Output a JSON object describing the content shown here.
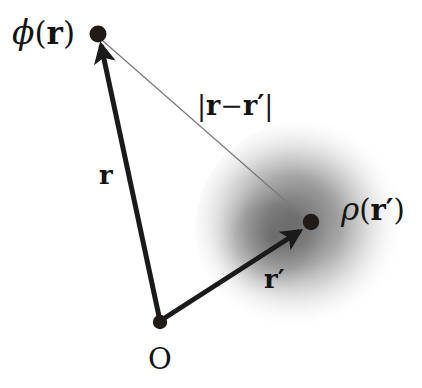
{
  "figure": {
    "background_color": "#ffffff",
    "width": 422,
    "height": 388
  },
  "colors": {
    "ink": "#141414",
    "vector": "#1a1a1a",
    "thin_line": "#7a7a7a",
    "cloud_core": "#6e6e6e",
    "cloud_edge": "#ffffff",
    "dot": "#211a16"
  },
  "points": {
    "field_point": {
      "label": "ϕ(𝐫)",
      "x": 98,
      "y": 34,
      "radius": 8
    },
    "origin": {
      "label": "O",
      "x": 160,
      "y": 322,
      "radius": 7
    },
    "source_point": {
      "label": "ρ(𝐫′)",
      "x": 311,
      "y": 222,
      "radius": 8
    }
  },
  "labels": {
    "phi": {
      "greek": "ϕ",
      "open": "(",
      "vector": "r",
      "close": ")"
    },
    "rho": {
      "greek": "ρ",
      "open": "(",
      "vector": "r",
      "prime": "′",
      "close": ")"
    },
    "distance": {
      "bar_left": "|",
      "vec1": "r",
      "minus": "−",
      "vec2": "r",
      "prime": "′",
      "bar_right": "|"
    },
    "vector_r": "r",
    "vector_r_prime": "r",
    "vector_r_prime_mark": "′",
    "origin": "O"
  },
  "geometry": {
    "vector_r": {
      "from": [
        160,
        322
      ],
      "to": [
        100,
        40
      ],
      "stroke_width": 5,
      "arrowhead": true
    },
    "vector_r_prime": {
      "from": [
        160,
        322
      ],
      "to": [
        304,
        229
      ],
      "stroke_width": 5,
      "arrowhead": true
    },
    "separation_line": {
      "from": [
        103,
        40
      ],
      "to": [
        305,
        218
      ],
      "stroke_width": 1.2,
      "arrowhead": false
    },
    "charge_cloud": {
      "cx": 305,
      "cy": 228,
      "rx": 110,
      "ry": 106
    }
  }
}
